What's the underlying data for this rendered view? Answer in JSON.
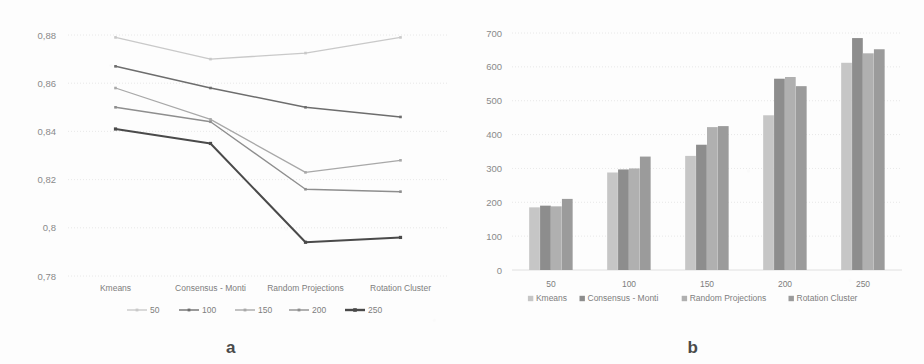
{
  "figure": {
    "panel_a_caption": "a",
    "panel_b_caption": "b"
  },
  "colors": {
    "series_50": "#c9c9c9",
    "series_100": "#6d6d6d",
    "series_150": "#a8a8a8",
    "series_200": "#8e8e8e",
    "series_250": "#4a4a4a",
    "bar_kmeans": "#c6c6c6",
    "bar_consensus": "#8d8d8d",
    "bar_random_projections": "#b0b0b0",
    "bar_rotation_cluster": "#9b9b9b",
    "grid": "#e2e2e2",
    "text": "#7d7d7d"
  },
  "chart_data": [
    {
      "id": "panel-a",
      "type": "line",
      "title": "",
      "xlabel": "",
      "ylabel": "",
      "categories": [
        "Kmeans",
        "Consensus - Monti",
        "Random Projections",
        "Rotation Cluster"
      ],
      "ylim": [
        0.78,
        0.88
      ],
      "yticks": [
        0.88,
        0.86,
        0.84,
        0.82,
        0.8,
        0.78
      ],
      "ytick_labels": [
        "0,88",
        "0,86",
        "0,84",
        "0,82",
        "0,8",
        "0,78"
      ],
      "grid": true,
      "legend_position": "bottom",
      "markers": "square",
      "series": [
        {
          "name": "50",
          "values": [
            0.879,
            0.87,
            0.8725,
            0.879
          ]
        },
        {
          "name": "100",
          "values": [
            0.867,
            0.858,
            0.85,
            0.846
          ]
        },
        {
          "name": "150",
          "values": [
            0.858,
            0.845,
            0.823,
            0.828
          ]
        },
        {
          "name": "200",
          "values": [
            0.85,
            0.844,
            0.816,
            0.815
          ]
        },
        {
          "name": "250",
          "values": [
            0.841,
            0.835,
            0.794,
            0.796
          ]
        }
      ]
    },
    {
      "id": "panel-b",
      "type": "bar",
      "title": "",
      "xlabel": "",
      "ylabel": "",
      "categories": [
        "50",
        "100",
        "150",
        "200",
        "250"
      ],
      "ylim": [
        0,
        700
      ],
      "yticks": [
        700,
        600,
        500,
        400,
        300,
        200,
        100,
        0
      ],
      "ytick_labels": [
        "700",
        "600",
        "500",
        "400",
        "300",
        "200",
        "100",
        "0"
      ],
      "grid": true,
      "legend_position": "bottom",
      "series": [
        {
          "name": "Kmeans",
          "values": [
            185,
            288,
            337,
            457,
            612
          ]
        },
        {
          "name": "Consensus - Monti",
          "values": [
            190,
            297,
            370,
            565,
            685
          ]
        },
        {
          "name": "Random Projections",
          "values": [
            188,
            300,
            422,
            570,
            640
          ]
        },
        {
          "name": "Rotation Cluster",
          "values": [
            210,
            335,
            425,
            543,
            652
          ]
        }
      ]
    }
  ]
}
